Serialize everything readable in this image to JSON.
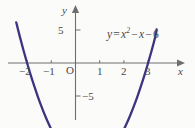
{
  "figure": {
    "width": 195,
    "height": 128,
    "background_color": "#fbfbfa",
    "curve_color": "#3b3580",
    "axis_color": "#6e6e6e",
    "text_color": "#4a4a4a"
  },
  "equation": {
    "lhs": "y",
    "equals": "=",
    "term1_base": "x",
    "term1_exp": "2",
    "minus1": "−",
    "term2": "x",
    "minus2": "−",
    "term3": "6",
    "full_text": "y = x² − x − 6"
  },
  "axes": {
    "y_axis_name": "y",
    "x_axis_name": "x",
    "origin_label": "O",
    "x_tick_labels": [
      "−2",
      "−1",
      "1",
      "2",
      "3"
    ],
    "y_tick_labels": [
      "5",
      "−5"
    ]
  },
  "chart_data": {
    "type": "line",
    "title": "",
    "subtitle": "",
    "xlabel": "x",
    "ylabel": "y",
    "annotations": [
      "y = x² − x − 6"
    ],
    "legend": [],
    "legend_position": "none",
    "grid": false,
    "xlim": [
      -2.45,
      3.35
    ],
    "ylim": [
      -7.6,
      6.9
    ],
    "xticks": [
      -2,
      -1,
      1,
      2,
      3
    ],
    "xticklabels": [
      "−2",
      "−1",
      "1",
      "2",
      "3"
    ],
    "yticks": [
      5,
      -5
    ],
    "yticklabels": [
      "5",
      "−5"
    ],
    "roots": [
      -2,
      3
    ],
    "vertex": [
      0.5,
      -6.25
    ],
    "y_intercept": -6,
    "series": [
      {
        "name": "y = x² − x − 6",
        "color": "#3b3580",
        "x": [
          -2.45,
          -2.3,
          -2.15,
          -2.0,
          -1.85,
          -1.7,
          -1.55,
          -1.4,
          -1.25,
          -1.1,
          -0.95,
          -0.8,
          -0.65,
          -0.5,
          -0.35,
          -0.2,
          -0.05,
          0.1,
          0.25,
          0.4,
          0.5,
          0.6,
          0.75,
          0.9,
          1.05,
          1.2,
          1.35,
          1.5,
          1.65,
          1.8,
          1.95,
          2.1,
          2.25,
          2.4,
          2.55,
          2.7,
          2.85,
          3.0,
          3.15,
          3.3,
          3.35
        ],
        "y": [
          2.45,
          1.59,
          0.77,
          0.0,
          -0.73,
          -1.41,
          -2.05,
          -2.64,
          -3.19,
          -3.69,
          -4.15,
          -4.56,
          -4.93,
          -5.25,
          -5.53,
          -5.76,
          -5.95,
          -6.09,
          -6.19,
          -6.24,
          -6.25,
          -6.24,
          -6.19,
          -6.09,
          -5.95,
          -5.76,
          -5.53,
          -5.25,
          -4.93,
          -4.56,
          -4.15,
          -3.69,
          -3.19,
          -2.64,
          -2.05,
          -1.41,
          -0.73,
          0.0,
          0.77,
          1.59,
          2.02
        ]
      }
    ]
  },
  "geometry": {
    "origin_px": [
      75.5,
      63.0
    ],
    "x_unit_px": 24.2,
    "y_unit_px": 16.6
  }
}
